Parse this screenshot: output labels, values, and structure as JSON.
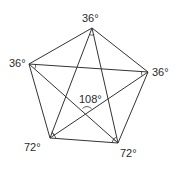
{
  "diagram": {
    "vertices": {
      "top": {
        "x": 92,
        "y": 28,
        "label": "36°"
      },
      "left": {
        "x": 29,
        "y": 64,
        "label": "36°"
      },
      "right": {
        "x": 148,
        "y": 72,
        "label": "36°"
      },
      "bottom_left": {
        "x": 50,
        "y": 138,
        "label": "72°"
      },
      "bottom_right": {
        "x": 118,
        "y": 143,
        "label": "72°"
      }
    },
    "center_angle": {
      "x": 87,
      "y": 112,
      "label": "108°"
    },
    "labels": {
      "top": "36°",
      "left": "36°",
      "right": "36°",
      "bottom_left": "72°",
      "bottom_right": "72°",
      "center": "108°"
    },
    "colors": {
      "line": "#333333",
      "text": "#2a2a2a",
      "background": "#ffffff"
    }
  }
}
